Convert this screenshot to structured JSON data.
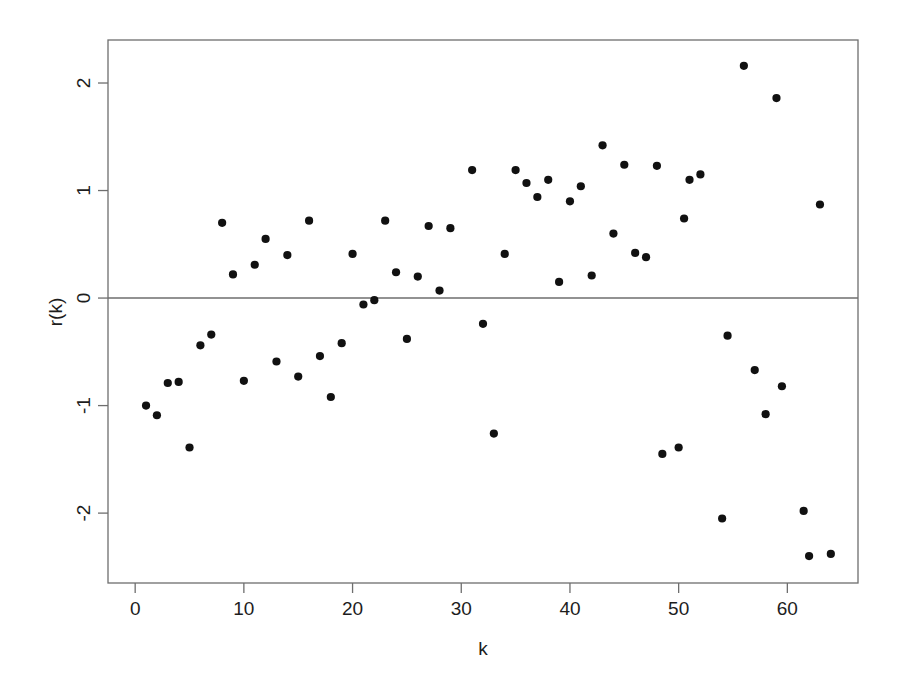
{
  "figure": {
    "background_color": "#ffffff",
    "point_color": "#111111",
    "axis_color": "#6e6e6e",
    "title": ""
  },
  "axes": {
    "x_title": "k",
    "y_title": "r(k)",
    "x_ticks": [
      "0",
      "10",
      "20",
      "30",
      "40",
      "50",
      "60"
    ],
    "y_ticks": [
      "2",
      "1",
      "0",
      "-1",
      "-2"
    ]
  },
  "chart_data": {
    "type": "scatter",
    "title": "",
    "xlabel": "k",
    "ylabel": "r(k)",
    "xlim": [
      -2.5,
      66.5
    ],
    "ylim": [
      -2.65,
      2.4
    ],
    "xticks": [
      0,
      10,
      20,
      30,
      40,
      50,
      60
    ],
    "yticks": [
      2,
      1,
      0,
      -1,
      -2
    ],
    "grid": false,
    "legend": null,
    "reference_lines": [
      {
        "orientation": "horizontal",
        "value": 0
      }
    ],
    "marker": "filled-circle",
    "series": [
      {
        "name": "r(k)",
        "color": "#111111",
        "points": [
          {
            "x": 1,
            "y": -1.0
          },
          {
            "x": 2,
            "y": -1.09
          },
          {
            "x": 3,
            "y": -0.79
          },
          {
            "x": 4,
            "y": -0.78
          },
          {
            "x": 5,
            "y": -1.39
          },
          {
            "x": 6,
            "y": -0.44
          },
          {
            "x": 7,
            "y": -0.34
          },
          {
            "x": 8,
            "y": 0.7
          },
          {
            "x": 9,
            "y": 0.22
          },
          {
            "x": 10,
            "y": -0.77
          },
          {
            "x": 11,
            "y": 0.31
          },
          {
            "x": 12,
            "y": 0.55
          },
          {
            "x": 13,
            "y": -0.59
          },
          {
            "x": 14,
            "y": 0.4
          },
          {
            "x": 15,
            "y": -0.73
          },
          {
            "x": 16,
            "y": 0.72
          },
          {
            "x": 17,
            "y": -0.54
          },
          {
            "x": 18,
            "y": -0.92
          },
          {
            "x": 19,
            "y": -0.42
          },
          {
            "x": 20,
            "y": 0.41
          },
          {
            "x": 21,
            "y": -0.06
          },
          {
            "x": 22,
            "y": -0.02
          },
          {
            "x": 23,
            "y": 0.72
          },
          {
            "x": 24,
            "y": 0.24
          },
          {
            "x": 25,
            "y": -0.38
          },
          {
            "x": 26,
            "y": 0.2
          },
          {
            "x": 27,
            "y": 0.67
          },
          {
            "x": 28,
            "y": 0.07
          },
          {
            "x": 29,
            "y": 0.65
          },
          {
            "x": 31,
            "y": 1.19
          },
          {
            "x": 32,
            "y": -0.24
          },
          {
            "x": 33,
            "y": -1.26
          },
          {
            "x": 34,
            "y": 0.41
          },
          {
            "x": 35,
            "y": 1.19
          },
          {
            "x": 36,
            "y": 1.07
          },
          {
            "x": 37,
            "y": 0.94
          },
          {
            "x": 38,
            "y": 1.1
          },
          {
            "x": 39,
            "y": 0.15
          },
          {
            "x": 40,
            "y": 0.9
          },
          {
            "x": 41,
            "y": 1.04
          },
          {
            "x": 42,
            "y": 0.21
          },
          {
            "x": 43,
            "y": 1.42
          },
          {
            "x": 44,
            "y": 0.6
          },
          {
            "x": 45,
            "y": 1.24
          },
          {
            "x": 46,
            "y": 0.42
          },
          {
            "x": 47,
            "y": 0.38
          },
          {
            "x": 48,
            "y": 1.23
          },
          {
            "x": 48.5,
            "y": -1.45
          },
          {
            "x": 50,
            "y": -1.39
          },
          {
            "x": 50.5,
            "y": 0.74
          },
          {
            "x": 51,
            "y": 1.1
          },
          {
            "x": 52,
            "y": 1.15
          },
          {
            "x": 54,
            "y": -2.05
          },
          {
            "x": 54.5,
            "y": -0.35
          },
          {
            "x": 56,
            "y": 2.16
          },
          {
            "x": 57,
            "y": -0.67
          },
          {
            "x": 58,
            "y": -1.08
          },
          {
            "x": 59,
            "y": 1.86
          },
          {
            "x": 59.5,
            "y": -0.82
          },
          {
            "x": 61.5,
            "y": -1.98
          },
          {
            "x": 62,
            "y": -2.4
          },
          {
            "x": 63,
            "y": 0.87
          },
          {
            "x": 64,
            "y": -2.38
          }
        ]
      }
    ]
  }
}
